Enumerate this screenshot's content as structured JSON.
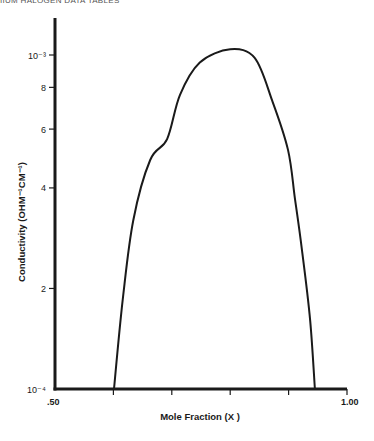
{
  "header": {
    "text": "IIUM HALOGEN DATA TABLES"
  },
  "chart_data": {
    "type": "line",
    "title": "",
    "xlabel": "Mole Fraction (X )",
    "ylabel": "Conductivity (OHM⁻¹CM⁻¹)",
    "xlim": [
      0.5,
      1.0
    ],
    "ylim": [
      0.0001,
      0.0011
    ],
    "yscale": "log",
    "grid": false,
    "x_tick_labels": [
      ".50",
      "1.00"
    ],
    "x_ticks": [
      0.5,
      0.6,
      0.7,
      0.8,
      0.9,
      1.0
    ],
    "y_tick_labels": [
      {
        "value": 0.0001,
        "label": "10⁻⁴"
      },
      {
        "value": 0.0002,
        "label": "2"
      },
      {
        "value": 0.0004,
        "label": "4"
      },
      {
        "value": 0.0006,
        "label": "6"
      },
      {
        "value": 0.0008,
        "label": "8"
      },
      {
        "value": 0.001,
        "label": "10⁻³"
      }
    ],
    "series": [
      {
        "name": "Conductivity",
        "x": [
          0.601,
          0.616,
          0.634,
          0.663,
          0.692,
          0.714,
          0.748,
          0.8,
          0.842,
          0.872,
          0.899,
          0.911,
          0.923,
          0.937,
          0.945
        ],
        "values": [
          0.0001,
          0.000185,
          0.00032,
          0.000485,
          0.00056,
          0.00076,
          0.00095,
          0.00104,
          0.00098,
          0.00073,
          0.00052,
          0.00037,
          0.00026,
          0.00016,
          0.0001
        ]
      }
    ]
  }
}
